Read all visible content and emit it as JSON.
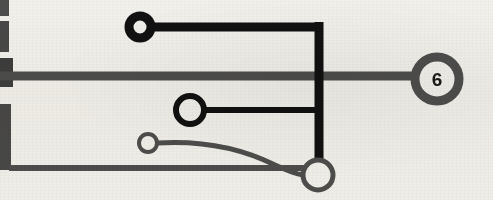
{
  "figure": {
    "background_color": "#f6f5f2",
    "ink_black": "#111111",
    "ink_gray": "#4f4f4f",
    "width": 493,
    "height": 200
  },
  "margin_bars": [
    {
      "name": "margin-bar-1",
      "x": 0,
      "y": 0,
      "w": 9,
      "h": 16,
      "color": "#4f4f4f"
    },
    {
      "name": "margin-bar-2",
      "x": 0,
      "y": 21,
      "w": 9,
      "h": 31,
      "color": "#4a4a4a"
    },
    {
      "name": "margin-bar-3",
      "x": 0,
      "y": 58,
      "w": 13,
      "h": 29,
      "color": "#3f3f3f"
    },
    {
      "name": "margin-bar-4",
      "x": 0,
      "y": 104,
      "w": 11,
      "h": 66,
      "color": "#4a4a4a"
    }
  ],
  "rails": [
    {
      "name": "upper-rail",
      "x1": 0,
      "y1": 76,
      "x2": 414,
      "y2": 76,
      "width": 9,
      "color": "#4f4f4f"
    },
    {
      "name": "lower-rail",
      "x1": 9,
      "y1": 168,
      "x2": 305,
      "y2": 168,
      "width": 6,
      "color": "#4f4f4f"
    }
  ],
  "edges": [
    {
      "name": "edge-top-horizontal",
      "from": "node-a",
      "to": "corner",
      "color": "#111111",
      "width": 9
    },
    {
      "name": "edge-vertical-trunk",
      "from": "corner",
      "to": "node-d",
      "color": "#111111",
      "width": 9
    },
    {
      "name": "edge-mid-horizontal",
      "from": "node-b",
      "to": "trunk",
      "color": "#111111",
      "width": 6
    },
    {
      "name": "edge-curve",
      "from": "node-c",
      "to": "node-d",
      "color": "#4f4f4f",
      "width": 5
    },
    {
      "name": "edge-rail-to-six",
      "from": "upper-rail",
      "to": "node-six",
      "color": "#4f4f4f",
      "width": 9
    }
  ],
  "nodes": [
    {
      "id": "node-a",
      "name": "node-top-black",
      "cx": 140,
      "cy": 27,
      "r": 11,
      "stroke": "#111111",
      "stroke_width": 9,
      "fill": "#f6f5f2",
      "label": ""
    },
    {
      "id": "node-b",
      "name": "node-middle-black",
      "cx": 190,
      "cy": 110,
      "r": 14,
      "stroke": "#111111",
      "stroke_width": 6,
      "fill": "#f6f5f2",
      "label": ""
    },
    {
      "id": "node-c",
      "name": "node-small-gray",
      "cx": 148,
      "cy": 143,
      "r": 9,
      "stroke": "#4f4f4f",
      "stroke_width": 4,
      "fill": "#f6f5f2",
      "label": ""
    },
    {
      "id": "node-d",
      "name": "node-bottom-gray",
      "cx": 318,
      "cy": 175,
      "r": 15,
      "stroke": "#4f4f4f",
      "stroke_width": 5,
      "fill": "#f6f5f2",
      "label": ""
    },
    {
      "id": "node-six",
      "name": "node-six-gray",
      "cx": 437,
      "cy": 79,
      "r": 22,
      "stroke": "#4f4f4f",
      "stroke_width": 9,
      "fill": "#f6f5f2",
      "label": "6"
    }
  ],
  "labels": {
    "node_six_value": "6"
  }
}
